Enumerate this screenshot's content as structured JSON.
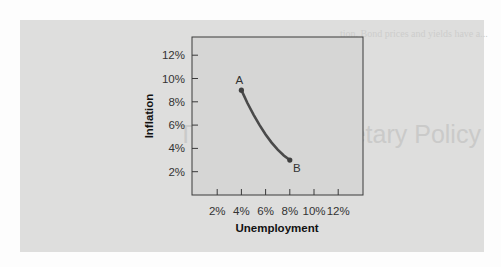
{
  "chart_data": {
    "type": "line",
    "title": "",
    "xlabel": "Unemployment",
    "ylabel": "Inflation",
    "xlim": [
      0,
      14
    ],
    "ylim": [
      0,
      13.5
    ],
    "x_ticks": [
      "2%",
      "4%",
      "6%",
      "8%",
      "10%",
      "12%"
    ],
    "y_ticks": [
      "2%",
      "4%",
      "6%",
      "8%",
      "10%",
      "12%"
    ],
    "grid": false,
    "legend": null,
    "series": [
      {
        "name": "Phillips curve",
        "x": [
          4,
          4.5,
          5,
          5.5,
          6,
          6.5,
          7,
          7.5,
          8
        ],
        "y": [
          9,
          7.9,
          6.9,
          6.0,
          5.2,
          4.5,
          3.9,
          3.4,
          3
        ]
      }
    ],
    "annotations": [
      {
        "label": "A",
        "x": 4,
        "y": 9
      },
      {
        "label": "B",
        "x": 8,
        "y": 3
      }
    ]
  },
  "ghost_text": {
    "heading": "Tradeoff in Monetary Policy"
  },
  "colors": {
    "panel_bg": "#dededd",
    "plot_bg": "#d6d6d5",
    "curve": "#4a4a4a",
    "axis": "#3a3a3a"
  }
}
